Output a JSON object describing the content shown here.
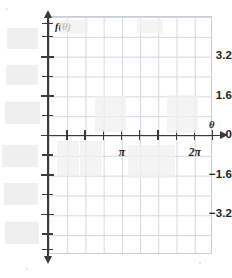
{
  "chart_data": {
    "type": "line",
    "title": "",
    "subtitle": "",
    "xlabel": "θ",
    "ylabel": "f(θ)",
    "grid": true,
    "legend": null,
    "series": [],
    "x": [],
    "values": [],
    "note": "Empty coordinate grid (blank graphing template) - no data curve is plotted",
    "xlim": [
      0,
      2.5
    ],
    "ylim": [
      -4.8,
      4.8
    ],
    "x_unit": "pi",
    "x_tick_values": [
      0,
      0.25,
      0.5,
      0.75,
      1,
      1.25,
      1.5,
      1.75,
      2,
      2.25
    ],
    "x_labeled_ticks": [
      {
        "value": 1,
        "label": "π"
      },
      {
        "value": 2,
        "label": "2π"
      }
    ],
    "y_tick_values": [
      4.8,
      4.0,
      3.2,
      2.4,
      1.6,
      0.8,
      0,
      -0.8,
      -1.6,
      -2.4,
      -3.2,
      -4.0,
      -4.8
    ],
    "y_labeled_ticks": [
      {
        "value": 3.2,
        "label": "3.2"
      },
      {
        "value": 1.6,
        "label": "1.6"
      },
      {
        "value": 0,
        "label": "0"
      },
      {
        "value": -1.6,
        "label": "−1.6"
      },
      {
        "value": -3.2,
        "label": "−3.2"
      }
    ]
  },
  "axes": {
    "y_axis_name": "f(θ)",
    "x_axis_name": "θ"
  },
  "y_ticks": [
    {
      "label": "",
      "top": 23.0,
      "major": false
    },
    {
      "label": "",
      "top": 36.1,
      "major": false
    },
    {
      "label": "3.2",
      "top": 56.0,
      "major": true
    },
    {
      "label": "",
      "top": 75.9,
      "major": false
    },
    {
      "label": "1.6",
      "top": 95.3,
      "major": true
    },
    {
      "label": "",
      "top": 115.0,
      "major": false
    },
    {
      "label": "0",
      "top": 134.7,
      "major": true
    },
    {
      "label": "",
      "top": 154.4,
      "major": false
    },
    {
      "label": "−1.6",
      "top": 174.1,
      "major": true
    },
    {
      "label": "",
      "top": 193.9,
      "major": false
    },
    {
      "label": "−3.2",
      "top": 213.6,
      "major": true
    },
    {
      "label": "",
      "top": 233.3,
      "major": false
    },
    {
      "label": "",
      "top": 249.0,
      "major": false
    }
  ],
  "x_ticks": [
    {
      "label": "",
      "left": 48.0
    },
    {
      "label": "",
      "left": 66.2
    },
    {
      "label": "",
      "left": 84.4
    },
    {
      "label": "",
      "left": 102.7
    },
    {
      "label": "π",
      "left": 120.9
    },
    {
      "label": "",
      "left": 139.1
    },
    {
      "label": "",
      "left": 157.3
    },
    {
      "label": "",
      "left": 175.6
    },
    {
      "label": "2π",
      "left": 193.8
    },
    {
      "label": "",
      "left": 212.0
    }
  ],
  "artifacts": [
    {
      "left": 7,
      "top": 28,
      "width": 31,
      "height": 21,
      "shade": "faint"
    },
    {
      "left": 6,
      "top": 65,
      "width": 32,
      "height": 20,
      "shade": "faint"
    },
    {
      "left": 5,
      "top": 102,
      "width": 35,
      "height": 22,
      "shade": "faint"
    },
    {
      "left": 2,
      "top": 145,
      "width": 36,
      "height": 22,
      "shade": "faint"
    },
    {
      "left": 4,
      "top": 183,
      "width": 34,
      "height": 22,
      "shade": "faint"
    },
    {
      "left": 5,
      "top": 222,
      "width": 34,
      "height": 22,
      "shade": "faint"
    },
    {
      "left": 95,
      "top": 96,
      "width": 31,
      "height": 36,
      "shade": "very-faint"
    },
    {
      "left": 167,
      "top": 95,
      "width": 31,
      "height": 38,
      "shade": "very-faint"
    },
    {
      "left": 57,
      "top": 141,
      "width": 22,
      "height": 35,
      "shade": "very-faint"
    },
    {
      "left": 80,
      "top": 141,
      "width": 22,
      "height": 35,
      "shade": "very-faint"
    },
    {
      "left": 128,
      "top": 145,
      "width": 24,
      "height": 33,
      "shade": "very-faint"
    },
    {
      "left": 152,
      "top": 145,
      "width": 23,
      "height": 33,
      "shade": "very-faint"
    },
    {
      "left": 60,
      "top": 20,
      "width": 28,
      "height": 14,
      "shade": "very-faint"
    },
    {
      "left": 137,
      "top": 20,
      "width": 26,
      "height": 13,
      "shade": "very-faint"
    }
  ],
  "specks": [
    {
      "left": 6,
      "top": 8,
      "size": 2
    },
    {
      "left": 199,
      "top": 262,
      "size": 2
    },
    {
      "left": 26,
      "top": 268,
      "size": 2
    }
  ]
}
